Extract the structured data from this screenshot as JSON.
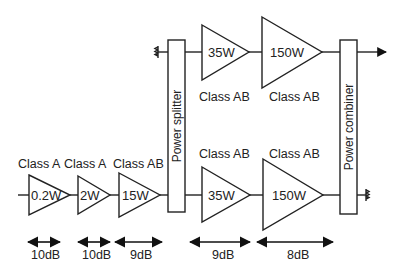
{
  "diagram": {
    "driver_chain": [
      {
        "power": "0.2W",
        "class": "Class A",
        "gain": "10dB"
      },
      {
        "power": "2W",
        "class": "Class A",
        "gain": "10dB"
      },
      {
        "power": "15W",
        "class": "Class AB",
        "gain": "9dB"
      }
    ],
    "splitter": {
      "label": "Power splitter"
    },
    "combiner": {
      "label": "Power combiner"
    },
    "top_branch": [
      {
        "power": "35W",
        "class": "Class AB"
      },
      {
        "power": "150W",
        "class": "Class AB"
      }
    ],
    "bottom_branch": [
      {
        "power": "35W",
        "class": "Class AB",
        "gain": "9dB"
      },
      {
        "power": "150W",
        "class": "Class AB",
        "gain": "8dB"
      }
    ]
  }
}
